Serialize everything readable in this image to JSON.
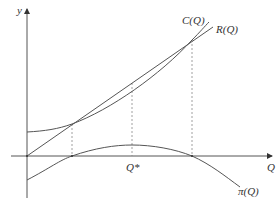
{
  "diagram": {
    "title": "",
    "axes": {
      "x_label": "Q",
      "y_label": "y"
    },
    "curves": [
      {
        "id": "cost",
        "label": "C(Q)",
        "shape": "convex curve with positive intercept"
      },
      {
        "id": "revenue",
        "label": "R(Q)",
        "shape": "straight line through origin"
      },
      {
        "id": "profit",
        "label": "π(Q)",
        "shape": "concave curve, negative intercept, maximum at Q*"
      }
    ],
    "markers": {
      "optimum_label": "Q*"
    },
    "colors": {
      "line": "#555555",
      "dashed": "#888888",
      "text": "#333333"
    }
  }
}
